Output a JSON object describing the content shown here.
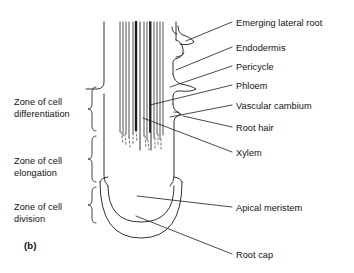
{
  "figure": {
    "panel_label": "(b)",
    "ink_color": "#1a1a1a",
    "background_color": "#ffffff"
  },
  "zones": [
    {
      "id": "zone-differentiation",
      "label": "Zone of cell\ndifferentiation",
      "x": 14,
      "y": 96
    },
    {
      "id": "zone-elongation",
      "label": "Zone of cell\nelongation",
      "x": 14,
      "y": 155
    },
    {
      "id": "zone-division",
      "label": "Zone of cell\ndivision",
      "x": 14,
      "y": 201
    }
  ],
  "callouts": [
    {
      "id": "emerging-lateral-root",
      "label": "Emerging lateral root",
      "x": 236,
      "y": 18
    },
    {
      "id": "endodermis",
      "label": "Endodermis",
      "x": 236,
      "y": 43
    },
    {
      "id": "pericycle",
      "label": "Pericycle",
      "x": 236,
      "y": 62
    },
    {
      "id": "phloem",
      "label": "Phloem",
      "x": 236,
      "y": 81
    },
    {
      "id": "vascular-cambium",
      "label": "Vascular cambium",
      "x": 236,
      "y": 101
    },
    {
      "id": "root-hair",
      "label": "Root hair",
      "x": 236,
      "y": 123
    },
    {
      "id": "xylem",
      "label": "Xylem",
      "x": 236,
      "y": 148
    },
    {
      "id": "apical-meristem",
      "label": "Apical meristem",
      "x": 236,
      "y": 203
    },
    {
      "id": "root-cap",
      "label": "Root cap",
      "x": 236,
      "y": 250
    }
  ]
}
